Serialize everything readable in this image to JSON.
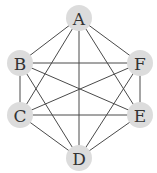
{
  "diagram": {
    "type": "graph",
    "colors": {
      "node_fill": "#dcdcdc",
      "edge": "#4a4a4a",
      "label": "#333333",
      "background": "#ffffff"
    },
    "nodes": [
      {
        "id": "A",
        "label": "A",
        "x": 79,
        "y": 18
      },
      {
        "id": "B",
        "label": "B",
        "x": 20,
        "y": 63
      },
      {
        "id": "F",
        "label": "F",
        "x": 140,
        "y": 63
      },
      {
        "id": "C",
        "label": "C",
        "x": 20,
        "y": 115
      },
      {
        "id": "E",
        "label": "E",
        "x": 140,
        "y": 115
      },
      {
        "id": "D",
        "label": "D",
        "x": 79,
        "y": 158
      }
    ],
    "edges": [
      [
        "A",
        "B"
      ],
      [
        "A",
        "F"
      ],
      [
        "A",
        "C"
      ],
      [
        "A",
        "D"
      ],
      [
        "A",
        "E"
      ],
      [
        "B",
        "C"
      ],
      [
        "B",
        "F"
      ],
      [
        "B",
        "E"
      ],
      [
        "B",
        "D"
      ],
      [
        "C",
        "D"
      ],
      [
        "C",
        "E"
      ],
      [
        "C",
        "F"
      ],
      [
        "D",
        "E"
      ],
      [
        "D",
        "F"
      ],
      [
        "E",
        "F"
      ]
    ]
  }
}
